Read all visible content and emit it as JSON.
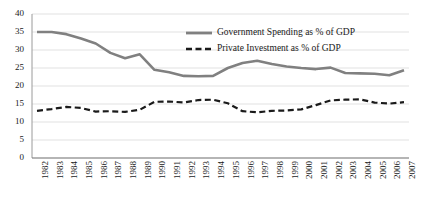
{
  "chart_data": {
    "type": "line",
    "title": "",
    "xlabel": "",
    "ylabel": "",
    "ylim": [
      0,
      40
    ],
    "yticks": [
      0,
      5,
      10,
      15,
      20,
      25,
      30,
      35,
      40
    ],
    "grid": true,
    "grid_axis": "y",
    "legend_position": "upper-right-inside",
    "categories": [
      "1982",
      "1983",
      "1984",
      "1985",
      "1986",
      "1987",
      "1988",
      "1989",
      "1990",
      "1991",
      "1992",
      "1993",
      "1994",
      "1995",
      "1996",
      "1997",
      "1998",
      "1999",
      "2000",
      "2001",
      "2002",
      "2003",
      "2004",
      "2005",
      "2006",
      "2007"
    ],
    "series": [
      {
        "name": "Government Spending as % of GDP",
        "color": "#808080",
        "style": "solid",
        "values": [
          35.0,
          35.0,
          34.4,
          33.2,
          31.8,
          29.2,
          27.7,
          28.8,
          24.5,
          23.8,
          22.8,
          22.7,
          22.8,
          25.0,
          26.4,
          27.0,
          26.1,
          25.4,
          25.0,
          24.7,
          25.1,
          23.6,
          23.5,
          23.4,
          23.0,
          24.4
        ]
      },
      {
        "name": "Private Investment as % of GDP",
        "color": "#1a1a1a",
        "style": "dashed",
        "values": [
          13.1,
          13.6,
          14.2,
          13.9,
          12.9,
          13.0,
          12.8,
          13.4,
          15.6,
          15.7,
          15.4,
          16.1,
          16.2,
          15.2,
          13.0,
          12.7,
          13.1,
          13.2,
          13.5,
          14.7,
          16.0,
          16.2,
          16.3,
          15.4,
          15.1,
          15.5
        ]
      }
    ],
    "series_extended": [
      {
        "name": "Government Spending as % of GDP",
        "points": [
          {
            "x": "1982",
            "y": 35.0
          },
          {
            "x": "1983",
            "y": 35.0
          },
          {
            "x": "1984",
            "y": 34.4
          },
          {
            "x": "1985",
            "y": 33.2
          },
          {
            "x": "1986",
            "y": 31.8
          },
          {
            "x": "1987",
            "y": 29.2
          },
          {
            "x": "1988",
            "y": 27.7
          },
          {
            "x": "1989",
            "y": 28.8
          },
          {
            "x": "1990",
            "y": 24.5
          },
          {
            "x": "1991",
            "y": 23.8
          },
          {
            "x": "1992",
            "y": 22.8
          },
          {
            "x": "1993",
            "y": 22.7
          },
          {
            "x": "1994",
            "y": 22.8
          },
          {
            "x": "1995",
            "y": 25.0
          },
          {
            "x": "1996",
            "y": 26.4
          },
          {
            "x": "1997",
            "y": 27.0
          },
          {
            "x": "1998",
            "y": 26.1
          },
          {
            "x": "1999",
            "y": 25.4
          },
          {
            "x": "2000",
            "y": 25.0
          },
          {
            "x": "2001",
            "y": 24.7
          },
          {
            "x": "2002",
            "y": 25.1
          },
          {
            "x": "2003",
            "y": 23.6
          },
          {
            "x": "2004",
            "y": 23.5
          },
          {
            "x": "2005",
            "y": 23.4
          },
          {
            "x": "2006",
            "y": 23.0
          },
          {
            "x": "2007",
            "y": 24.4
          }
        ]
      }
    ],
    "annotations": []
  },
  "legend": {
    "items": [
      {
        "label": "Government Spending as % of GDP",
        "swatch": "solid-gray-line"
      },
      {
        "label": "Private Investment as % of GDP",
        "swatch": "dashed-black-line"
      }
    ]
  },
  "axes": {
    "y_tick_labels": [
      "40",
      "35",
      "30",
      "25",
      "20",
      "15",
      "10",
      "5",
      "0"
    ],
    "x_tick_labels": [
      "1982",
      "1983",
      "1984",
      "1985",
      "1986",
      "1987",
      "1988",
      "1989",
      "1990",
      "1991",
      "1992",
      "1993",
      "1994",
      "1995",
      "1996",
      "1997",
      "1998",
      "1999",
      "2000",
      "2001",
      "2002",
      "2003",
      "2004",
      "2005",
      "2006",
      "2007"
    ]
  },
  "colors": {
    "government_line": "#808080",
    "investment_line": "#1a1a1a",
    "gridline": "#d9d9d9",
    "axis": "#808080",
    "text": "#1a1a1a",
    "background": "#ffffff"
  }
}
